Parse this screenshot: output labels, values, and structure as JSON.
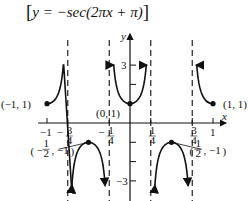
{
  "chart_data": {
    "type": "line",
    "title_parts": {
      "open": "[",
      "body": "y = −sec(2πx + π)",
      "close": "]"
    },
    "xlabel": "x",
    "ylabel": "y",
    "xlim": [
      -1,
      1
    ],
    "ylim": [
      -3.5,
      3.5
    ],
    "grid": false,
    "x_ticks": [
      {
        "value": -1,
        "label": "−1"
      },
      {
        "value": -0.75,
        "label": "−3/4"
      },
      {
        "value": -0.25,
        "label": "−1/4"
      },
      {
        "value": 0.25,
        "label": "1/4"
      },
      {
        "value": 0.75,
        "label": "3/4"
      },
      {
        "value": 1,
        "label": "1"
      }
    ],
    "y_ticks": [
      {
        "value": 3,
        "label": "3"
      },
      {
        "value": 2,
        "label": ""
      },
      {
        "value": -1,
        "label": ""
      },
      {
        "value": -2,
        "label": ""
      },
      {
        "value": -3,
        "label": "−3"
      }
    ],
    "asymptotes": [
      -0.75,
      -0.25,
      0.25,
      0.75
    ],
    "labeled_points": [
      {
        "x": -1,
        "y": 1,
        "label": "(−1, 1)"
      },
      {
        "x": 0,
        "y": 1,
        "label": "(0, 1)"
      },
      {
        "x": 1,
        "y": 1,
        "label": "(1, 1)"
      },
      {
        "x": -0.5,
        "y": -1,
        "label": "(−1/2, −1)"
      },
      {
        "x": 0.5,
        "y": -1,
        "label": "(1/2, −1)"
      }
    ],
    "series": [
      {
        "name": "y = -sec(2πx + π)",
        "function": "-1/cos(2*pi*x + pi)",
        "domain": [
          -1,
          1
        ]
      }
    ]
  }
}
